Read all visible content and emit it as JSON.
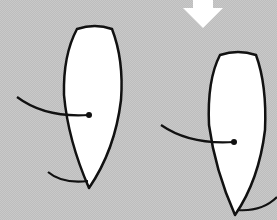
{
  "illustration": {
    "description": "Two white blade-shaped forms with pivot lines and a downward arrow",
    "colors": {
      "background": "#c9c9c9",
      "shape_fill": "#ffffff",
      "stroke": "#111111",
      "arrow": "#ffffff"
    },
    "icons": [
      "down-arrow-icon"
    ],
    "blades": [
      {
        "label": "",
        "position": "left"
      },
      {
        "label": "",
        "position": "right"
      }
    ]
  }
}
